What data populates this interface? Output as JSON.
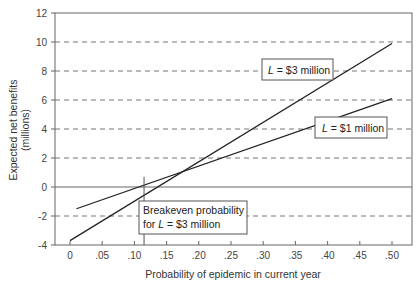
{
  "chart_data": {
    "type": "line",
    "title": "",
    "xlabel": "Probability of epidemic in current year",
    "ylabel": "Expected net benefits (millions)",
    "ylabel_lines": [
      "Expected net benefits",
      "(millions)"
    ],
    "xlim": [
      -0.01,
      0.52
    ],
    "ylim": [
      -4,
      12
    ],
    "x_ticks": [
      0,
      0.05,
      0.1,
      0.15,
      0.2,
      0.25,
      0.3,
      0.35,
      0.4,
      0.45,
      0.5
    ],
    "x_tick_labels": [
      "0",
      ".05",
      ".10",
      ".15",
      ".20",
      ".25",
      ".30",
      ".35",
      ".40",
      ".45",
      ".50"
    ],
    "y_ticks": [
      -4,
      -2,
      0,
      2,
      4,
      6,
      8,
      10,
      12
    ],
    "y_tick_labels": [
      "-4",
      "-2",
      "0",
      "2",
      "4",
      "6",
      "8",
      "10",
      "12"
    ],
    "grid": "horizontal dashed at -2, 2, 4, 6, 8, 10; solid at 0",
    "series": [
      {
        "name": "L = $3 million",
        "x": [
          0.0,
          0.5
        ],
        "values": [
          -3.7,
          9.9
        ]
      },
      {
        "name": "L = $1 million",
        "x": [
          0.01,
          0.5
        ],
        "values": [
          -1.5,
          6.1
        ]
      }
    ],
    "annotations": [
      {
        "text": "L = $3 million",
        "label_prefix": "L",
        "label_rest": " = $3 million",
        "x": 0.32,
        "y": 8.0
      },
      {
        "text": "L = $1 million",
        "label_prefix": "L",
        "label_rest": " = $1 million",
        "x": 0.42,
        "y": 4.0
      },
      {
        "text_lines": [
          "Breakeven probability",
          "for L = $3 million"
        ],
        "line1": "Breakeven probability",
        "line2_prefix": "for ",
        "line2_italic": "L",
        "line2_rest": " = $3 million",
        "x": 0.115,
        "y": -1.5,
        "breakeven_x": 0.115
      }
    ]
  }
}
